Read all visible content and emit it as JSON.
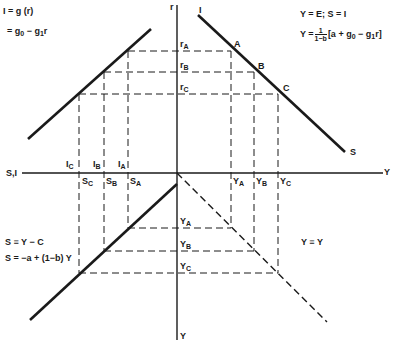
{
  "diagram": {
    "colors": {
      "ink": "#1a1a1a",
      "background": "#ffffff"
    },
    "axes": {
      "vertical_top": "r",
      "vertical_bottom": "Y",
      "horizontal_left": "S,I",
      "horizontal_right": "Y"
    },
    "quadrant_top_left": {
      "eq1": "I = g (r)",
      "eq2_prefix": "= g",
      "eq2_sub0": "0",
      "eq2_mid": " − g",
      "eq2_sub1": "1",
      "eq2_suffix": "r"
    },
    "quadrant_top_right": {
      "eq1": "Y = E;  S = I",
      "eq2_prefix": "Y =",
      "frac_num": "1",
      "frac_den": "1−b",
      "eq2_body_a": "[a + g",
      "eq2_sub0": "0",
      "eq2_body_b": " − g",
      "eq2_sub1": "1",
      "eq2_body_c": "r]",
      "curve_top_label": "I",
      "curve_bottom_label": "S",
      "points": [
        "A",
        "B",
        "C"
      ]
    },
    "quadrant_bottom_left": {
      "eq1": "S ≡ Y − C",
      "eq2": "S = −a + (1−b) Y"
    },
    "quadrant_bottom_right": {
      "eq1": "Y ≡ Y"
    },
    "r_labels": [
      {
        "base": "r",
        "sub": "A"
      },
      {
        "base": "r",
        "sub": "B"
      },
      {
        "base": "r",
        "sub": "C"
      }
    ],
    "i_labels": [
      {
        "base": "I",
        "sub": "C"
      },
      {
        "base": "I",
        "sub": "B"
      },
      {
        "base": "I",
        "sub": "A"
      }
    ],
    "s_labels": [
      {
        "base": "S",
        "sub": "C"
      },
      {
        "base": "S",
        "sub": "B"
      },
      {
        "base": "S",
        "sub": "A"
      }
    ],
    "y_axis_labels": [
      {
        "base": "Y",
        "sub": "A"
      },
      {
        "base": "Y",
        "sub": "B"
      },
      {
        "base": "Y",
        "sub": "C"
      }
    ],
    "y_vertical_labels": [
      {
        "base": "Y",
        "sub": "A"
      },
      {
        "base": "Y",
        "sub": "B"
      },
      {
        "base": "Y",
        "sub": "C"
      }
    ]
  }
}
